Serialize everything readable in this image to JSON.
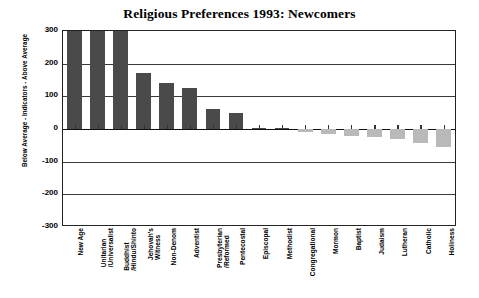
{
  "chart_data": {
    "type": "bar",
    "title": "Religious Preferences 1993: Newcomers",
    "xlabel": "",
    "ylabel": "Below Average - Indicators - Above Average",
    "ylim": [
      -300,
      300
    ],
    "yticks": [
      300,
      200,
      100,
      0,
      -100,
      -200,
      -300
    ],
    "ytick_labels": [
      "300",
      "200",
      "100",
      "0",
      "-100",
      "-200",
      "-300"
    ],
    "grid": true,
    "legend": "none",
    "clipped_note": "First three bars are clipped at the 300 axis maximum",
    "colors": {
      "positive_bar": "#4a4a4a",
      "negative_bar": "#b9b9b9",
      "axis": "#222222",
      "gridline": "#3a3a3a",
      "background": "#ffffff",
      "text": "#000000"
    },
    "categories": [
      "New Age",
      "Unitarian\n/Universalist",
      "Buddhist\n/Hindu/Shinto",
      "Jehovah's\nWitness",
      "Non-Denom",
      "Adventist",
      "Presbyterian\n/Reformed",
      "Pentecostal",
      "Episcopal",
      "Methodist",
      "Congregational",
      "Mormon",
      "Baptist",
      "Judaism",
      "Lutheran",
      "Catholic",
      "Holiness"
    ],
    "values": [
      300,
      300,
      300,
      172,
      140,
      125,
      62,
      50,
      4,
      2,
      -8,
      -15,
      -20,
      -25,
      -32,
      -42,
      -55
    ]
  }
}
